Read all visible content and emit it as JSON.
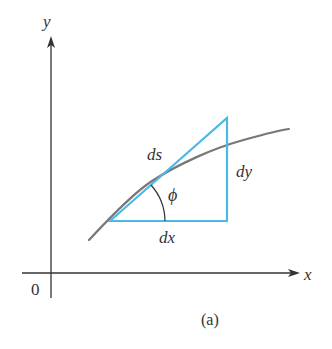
{
  "figure": {
    "caption": "(a)",
    "axes": {
      "x_label": "x",
      "y_label": "y",
      "origin_label": "0"
    },
    "labels": {
      "hypotenuse": "ds",
      "vertical_leg": "dy",
      "horizontal_leg": "dx",
      "angle": "ϕ"
    },
    "colors": {
      "axis": "#333333",
      "curve": "#777777",
      "triangle": "#4db8e8",
      "text": "#333333",
      "background": "#ffffff"
    }
  }
}
